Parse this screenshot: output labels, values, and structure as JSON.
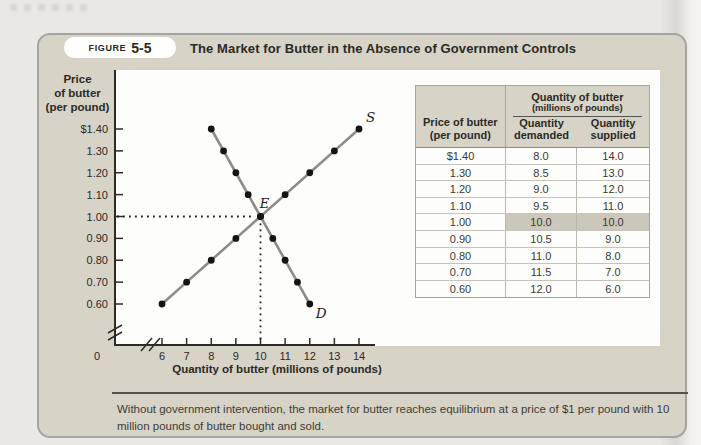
{
  "header": {
    "figure_label": "FIGURE",
    "figure_number": "5-5",
    "title": "The Market for Butter in the Absence of Government Controls"
  },
  "chart_data": {
    "type": "line",
    "title": "",
    "xlabel": "Quantity of butter (millions of pounds)",
    "ylabel": "Price of butter (per pound)",
    "ylabel_lines": [
      "Price",
      "of butter",
      "(per pound)"
    ],
    "x_origin_label": "0",
    "x_ticks": [
      6,
      7,
      8,
      9,
      10,
      11,
      12,
      13,
      14
    ],
    "y_ticks": [
      1.4,
      1.3,
      1.2,
      1.1,
      1.0,
      0.9,
      0.8,
      0.7,
      0.6
    ],
    "y_tick_labels": [
      "$1.40",
      "1.30",
      "1.20",
      "1.10",
      "1.00",
      "0.90",
      "0.80",
      "0.70",
      "0.60"
    ],
    "xlim": [
      6,
      14
    ],
    "ylim": [
      0.6,
      1.4
    ],
    "axis_breaks": true,
    "grid": false,
    "series": [
      {
        "name": "supply",
        "label": "S",
        "points": [
          [
            6,
            0.6
          ],
          [
            7,
            0.7
          ],
          [
            8,
            0.8
          ],
          [
            9,
            0.9
          ],
          [
            10,
            1.0
          ],
          [
            11,
            1.1
          ],
          [
            12,
            1.2
          ],
          [
            13,
            1.3
          ],
          [
            14,
            1.4
          ]
        ]
      },
      {
        "name": "demand",
        "label": "D",
        "points": [
          [
            8,
            1.4
          ],
          [
            8.5,
            1.3
          ],
          [
            9,
            1.2
          ],
          [
            9.5,
            1.1
          ],
          [
            10,
            1.0
          ],
          [
            10.5,
            0.9
          ],
          [
            11,
            0.8
          ],
          [
            11.5,
            0.7
          ],
          [
            12,
            0.6
          ]
        ]
      }
    ],
    "equilibrium": {
      "label": "E",
      "x": 10,
      "y": 1.0
    }
  },
  "table": {
    "span_header_line1": "Quantity of butter",
    "span_header_line2": "(millions of pounds)",
    "price_header_line1": "Price of butter",
    "price_header_line2": "(per pound)",
    "demanded_header_line1": "Quantity",
    "demanded_header_line2": "demanded",
    "supplied_header_line1": "Quantity",
    "supplied_header_line2": "supplied",
    "rows": [
      {
        "price": "$1.40",
        "demanded": "8.0",
        "supplied": "14.0",
        "highlight": false
      },
      {
        "price": "1.30",
        "demanded": "8.5",
        "supplied": "13.0",
        "highlight": false
      },
      {
        "price": "1.20",
        "demanded": "9.0",
        "supplied": "12.0",
        "highlight": false
      },
      {
        "price": "1.10",
        "demanded": "9.5",
        "supplied": "11.0",
        "highlight": false
      },
      {
        "price": "1.00",
        "demanded": "10.0",
        "supplied": "10.0",
        "highlight": true
      },
      {
        "price": "0.90",
        "demanded": "10.5",
        "supplied": "9.0",
        "highlight": false
      },
      {
        "price": "0.80",
        "demanded": "11.0",
        "supplied": "8.0",
        "highlight": false
      },
      {
        "price": "0.70",
        "demanded": "11.5",
        "supplied": "7.0",
        "highlight": false
      },
      {
        "price": "0.60",
        "demanded": "12.0",
        "supplied": "6.0",
        "highlight": false
      }
    ]
  },
  "caption": "Without government intervention, the market for butter reaches equilibrium at a price of $1 per pound with 10 million pounds of butter bought and sold.",
  "colors": {
    "panel_bg": "#d7d3c7",
    "highlight_row": "#cbc7ba",
    "curve": "#8b8b89",
    "dot": "#141412",
    "axis": "#2c2b27",
    "text_dark": "#2b2a25"
  }
}
